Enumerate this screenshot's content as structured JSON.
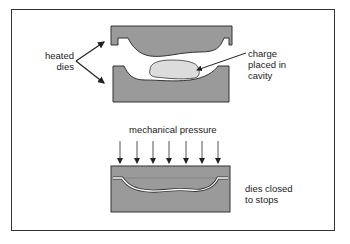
{
  "labels": {
    "heated_dies": [
      "heated",
      "dies"
    ],
    "charge": [
      "charge",
      "placed in",
      "cavity"
    ],
    "pressure": "mechanical pressure",
    "closed": [
      "dies closed",
      "to stops"
    ]
  },
  "colors": {
    "die_fill": "#9a9a9a",
    "charge_fill": "#dcdcdc",
    "outline": "#333333"
  },
  "pressure_arrow_count": 7
}
